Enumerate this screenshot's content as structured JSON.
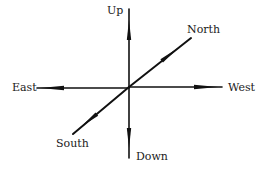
{
  "diagram": {
    "type": "direction-axes",
    "colors": {
      "line": "#111111",
      "text": "#1a1a1a",
      "background": "#ffffff"
    },
    "center": {
      "x": 129,
      "y": 87
    },
    "axes": [
      {
        "id": "up",
        "label": "Up",
        "end": {
          "x": 129,
          "y": 9
        },
        "label_pos": {
          "x": 107,
          "y": 5
        }
      },
      {
        "id": "down",
        "label": "Down",
        "end": {
          "x": 129,
          "y": 158
        },
        "label_pos": {
          "x": 136,
          "y": 150
        }
      },
      {
        "id": "east",
        "label": "East",
        "end": {
          "x": 37,
          "y": 88
        },
        "label_pos": {
          "x": 12,
          "y": 82
        }
      },
      {
        "id": "west",
        "label": "West",
        "end": {
          "x": 222,
          "y": 87
        },
        "label_pos": {
          "x": 228,
          "y": 82
        }
      },
      {
        "id": "north",
        "label": "North",
        "end": {
          "x": 191,
          "y": 38
        },
        "label_pos": {
          "x": 187,
          "y": 24
        }
      },
      {
        "id": "south",
        "label": "South",
        "end": {
          "x": 73,
          "y": 134
        },
        "label_pos": {
          "x": 56,
          "y": 138
        }
      }
    ]
  }
}
